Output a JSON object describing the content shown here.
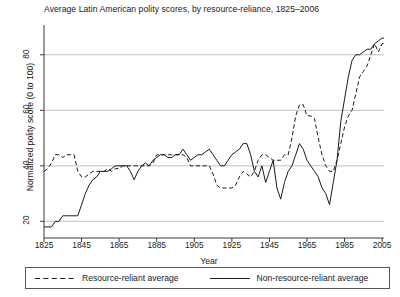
{
  "chart_data": {
    "type": "line",
    "title": "Average Latin American polity scores, by resource-reliance, 1825–2006",
    "xlabel": "Year",
    "ylabel": "Normalized polity score (0 to 100)",
    "xlim": [
      1825,
      2006
    ],
    "ylim": [
      14,
      90
    ],
    "xticks": [
      "1825",
      "1845",
      "1865",
      "1885",
      "1905",
      "1925",
      "1945",
      "1965",
      "1985",
      "2005"
    ],
    "xtick_values": [
      1825,
      1845,
      1865,
      1885,
      1905,
      1925,
      1945,
      1965,
      1985,
      2005
    ],
    "yticks": [
      "20",
      "40",
      "60",
      "80"
    ],
    "ytick_values": [
      20,
      40,
      60,
      80
    ],
    "grid": "horizontal",
    "legend_position": "below-plot",
    "series": [
      {
        "name": "Resource-reliant average",
        "style": "dashed",
        "color": "#1a1a1a",
        "x": [
          1825,
          1827,
          1829,
          1831,
          1833,
          1835,
          1837,
          1839,
          1841,
          1843,
          1845,
          1847,
          1849,
          1851,
          1853,
          1855,
          1857,
          1859,
          1861,
          1863,
          1865,
          1867,
          1869,
          1871,
          1873,
          1875,
          1877,
          1879,
          1881,
          1883,
          1885,
          1887,
          1889,
          1891,
          1893,
          1895,
          1897,
          1899,
          1901,
          1903,
          1905,
          1907,
          1909,
          1911,
          1913,
          1915,
          1917,
          1919,
          1921,
          1923,
          1925,
          1927,
          1929,
          1931,
          1933,
          1935,
          1937,
          1939,
          1941,
          1943,
          1945,
          1947,
          1949,
          1951,
          1953,
          1955,
          1957,
          1959,
          1961,
          1963,
          1965,
          1967,
          1969,
          1971,
          1973,
          1975,
          1977,
          1979,
          1981,
          1983,
          1985,
          1987,
          1989,
          1991,
          1993,
          1995,
          1997,
          1999,
          2001,
          2003,
          2005,
          2006
        ],
        "y": [
          38,
          39,
          41,
          44,
          44,
          43,
          44,
          44,
          44,
          38,
          36,
          36,
          37,
          38,
          38,
          38,
          38,
          39,
          38,
          39,
          39,
          40,
          40,
          40,
          40,
          40,
          40,
          40,
          40,
          41,
          44,
          44,
          44,
          44,
          44,
          44,
          44,
          44,
          43,
          40,
          40,
          40,
          40,
          40,
          40,
          37,
          33,
          32,
          32,
          32,
          32,
          33,
          36,
          38,
          37,
          36,
          38,
          42,
          44,
          44,
          43,
          42,
          42,
          42,
          44,
          44,
          50,
          58,
          62,
          62,
          58,
          58,
          57,
          50,
          44,
          40,
          38,
          38,
          42,
          48,
          54,
          58,
          60,
          66,
          72,
          74,
          76,
          80,
          84,
          81,
          84,
          84
        ]
      },
      {
        "name": "Non-resource-reliant average",
        "style": "solid",
        "color": "#1a1a1a",
        "x": [
          1825,
          1827,
          1829,
          1831,
          1833,
          1835,
          1837,
          1839,
          1841,
          1843,
          1845,
          1847,
          1849,
          1851,
          1853,
          1855,
          1857,
          1859,
          1861,
          1863,
          1865,
          1867,
          1869,
          1871,
          1873,
          1875,
          1877,
          1879,
          1881,
          1883,
          1885,
          1887,
          1889,
          1891,
          1893,
          1895,
          1897,
          1899,
          1901,
          1903,
          1905,
          1907,
          1909,
          1911,
          1913,
          1915,
          1917,
          1919,
          1921,
          1923,
          1925,
          1927,
          1929,
          1931,
          1933,
          1935,
          1937,
          1939,
          1941,
          1943,
          1945,
          1947,
          1949,
          1951,
          1953,
          1955,
          1957,
          1959,
          1961,
          1963,
          1965,
          1967,
          1969,
          1971,
          1973,
          1975,
          1977,
          1979,
          1981,
          1983,
          1985,
          1987,
          1989,
          1991,
          1993,
          1995,
          1997,
          1999,
          2001,
          2003,
          2005,
          2006
        ],
        "y": [
          18,
          18,
          18,
          20,
          20,
          22,
          22,
          22,
          22,
          22,
          26,
          30,
          33,
          35,
          36,
          38,
          38,
          38,
          39,
          40,
          40,
          40,
          40,
          38,
          35,
          38,
          40,
          41,
          40,
          42,
          43,
          44,
          44,
          43,
          43,
          44,
          44,
          46,
          44,
          42,
          43,
          44,
          44,
          45,
          46,
          44,
          42,
          40,
          40,
          42,
          44,
          45,
          46,
          48,
          48,
          44,
          38,
          36,
          40,
          34,
          38,
          42,
          32,
          28,
          34,
          38,
          40,
          44,
          48,
          46,
          42,
          40,
          38,
          36,
          32,
          30,
          26,
          34,
          42,
          56,
          64,
          72,
          78,
          80,
          80,
          81,
          82,
          82,
          84,
          85,
          86,
          86
        ]
      }
    ]
  }
}
